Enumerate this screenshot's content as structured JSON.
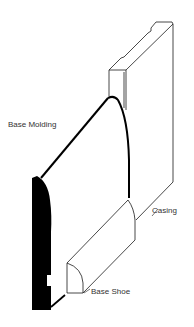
{
  "diagram": {
    "title": "",
    "labels": {
      "base_molding": "Base Molding",
      "casing": "Casing",
      "base_shoe": "Base Shoe"
    },
    "colors": {
      "line": "#1a1a1a",
      "profile_fill": "#000000",
      "text": "#333333",
      "background": "#ffffff"
    }
  }
}
